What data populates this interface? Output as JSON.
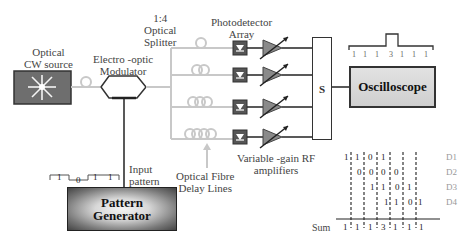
{
  "diagram": {
    "type": "optical signal processing block diagram",
    "labels": {
      "cw_source": [
        "Optical",
        "CW source"
      ],
      "modulator": [
        "Electro -optic",
        "Modulator"
      ],
      "splitter": [
        "1:4",
        "Optical",
        "Splitter"
      ],
      "photodetector": [
        "Photodetector",
        "Array"
      ],
      "amplifiers": [
        "Variable -gain RF",
        "amplifiers"
      ],
      "delay_lines": [
        "Optical Fibre",
        "Delay Lines"
      ],
      "input_pattern": [
        "Input",
        "pattern"
      ],
      "sum_block": "S",
      "oscilloscope": "Oscilloscope",
      "pattern_generator": [
        "Pattern",
        "Generator"
      ]
    },
    "input_pattern_bits": [
      "1",
      "0",
      "1",
      "1"
    ],
    "oscilloscope_output_values": [
      "1",
      "1",
      "1",
      "3",
      "1",
      "1",
      "1"
    ],
    "timing_table": {
      "rows": [
        {
          "label": "D1",
          "bits": [
            "1",
            "1",
            "0",
            "1"
          ]
        },
        {
          "label": "D2",
          "bits": [
            "0",
            "0",
            "0",
            "0"
          ]
        },
        {
          "label": "D3",
          "bits": [
            "1",
            "1",
            "0",
            "1"
          ]
        },
        {
          "label": "D4",
          "bits": [
            "1",
            "1",
            "0",
            "1"
          ]
        }
      ],
      "sum_label": "Sum",
      "sum_values": [
        "1",
        "1",
        "1",
        "3",
        "1",
        "1",
        "1"
      ]
    },
    "colors": {
      "fibre": "#c8c8c8",
      "line": "#333333",
      "detector": "#555555",
      "amplifier": "#8a8a8a",
      "source_box": "#6e6e6e",
      "delay_label": "#999999"
    }
  }
}
